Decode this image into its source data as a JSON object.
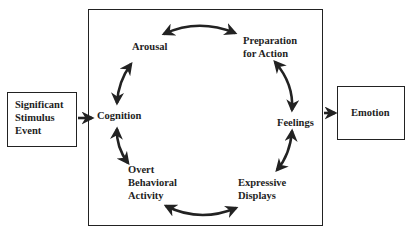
{
  "diagram": {
    "type": "cyclic-process",
    "input_box": {
      "label": "Significant\nStimulus\nEvent"
    },
    "output_box": {
      "label": "Emotion"
    },
    "cycle_nodes": [
      {
        "id": "cognition",
        "label": "Cognition"
      },
      {
        "id": "arousal",
        "label": "Arousal"
      },
      {
        "id": "preparation",
        "label": "Preparation\nfor Action"
      },
      {
        "id": "feelings",
        "label": "Feelings"
      },
      {
        "id": "expressive",
        "label": "Expressive\nDisplays"
      },
      {
        "id": "overt",
        "label": "Overt\nBehavioral\nActivity"
      }
    ],
    "edges": [
      {
        "from": "input_box",
        "to": "cognition",
        "type": "single"
      },
      {
        "from": "cognition",
        "to": "arousal",
        "type": "double"
      },
      {
        "from": "arousal",
        "to": "preparation",
        "type": "double"
      },
      {
        "from": "preparation",
        "to": "feelings",
        "type": "double"
      },
      {
        "from": "feelings",
        "to": "expressive",
        "type": "double"
      },
      {
        "from": "expressive",
        "to": "overt",
        "type": "double"
      },
      {
        "from": "overt",
        "to": "cognition",
        "type": "double"
      },
      {
        "from": "main_box",
        "to": "output_box",
        "type": "single"
      }
    ],
    "colors": {
      "line": "#222222",
      "background": "#ffffff"
    }
  }
}
